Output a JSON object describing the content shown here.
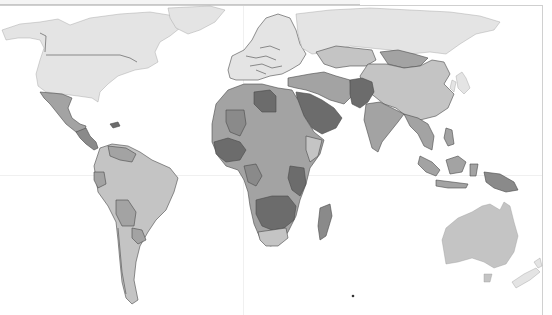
{
  "map": {
    "type": "choropleth",
    "projection": "world",
    "legend_visible": false,
    "title_visible": false,
    "shade_classes": {
      "very_light": "#e4e4e4",
      "light": "#c4c4c4",
      "medium": "#a3a3a3",
      "medium_dark": "#8a8a8a",
      "dark": "#6c6c6c"
    },
    "background": "#ffffff",
    "ocean": "#ffffff",
    "regions": [
      {
        "name": "north-america",
        "shade": "very_light"
      },
      {
        "name": "greenland",
        "shade": "very_light"
      },
      {
        "name": "europe",
        "shade": "very_light"
      },
      {
        "name": "russia",
        "shade": "very_light"
      },
      {
        "name": "mexico",
        "shade": "medium"
      },
      {
        "name": "central-america",
        "shade": "medium_dark"
      },
      {
        "name": "south-america",
        "shade": "light"
      },
      {
        "name": "bolivia",
        "shade": "medium"
      },
      {
        "name": "paraguay",
        "shade": "medium"
      },
      {
        "name": "peru-ecuador",
        "shade": "medium"
      },
      {
        "name": "venezuela-guyana",
        "shade": "medium"
      },
      {
        "name": "north-africa",
        "shade": "medium"
      },
      {
        "name": "libya",
        "shade": "dark"
      },
      {
        "name": "mali",
        "shade": "medium_dark"
      },
      {
        "name": "west-africa",
        "shade": "dark"
      },
      {
        "name": "central-africa",
        "shade": "medium"
      },
      {
        "name": "east-africa",
        "shade": "dark"
      },
      {
        "name": "southern-africa",
        "shade": "dark"
      },
      {
        "name": "south-africa",
        "shade": "light"
      },
      {
        "name": "madagascar",
        "shade": "medium_dark"
      },
      {
        "name": "arabian-peninsula",
        "shade": "dark"
      },
      {
        "name": "turkey-iran",
        "shade": "medium"
      },
      {
        "name": "afghanistan-pakistan",
        "shade": "dark"
      },
      {
        "name": "kazakhstan",
        "shade": "light"
      },
      {
        "name": "mongolia",
        "shade": "medium"
      },
      {
        "name": "china",
        "shade": "light"
      },
      {
        "name": "india",
        "shade": "medium"
      },
      {
        "name": "southeast-asia",
        "shade": "medium"
      },
      {
        "name": "indonesia",
        "shade": "medium"
      },
      {
        "name": "papua-new-guinea",
        "shade": "medium_dark"
      },
      {
        "name": "japan-korea",
        "shade": "very_light"
      },
      {
        "name": "australia",
        "shade": "light"
      },
      {
        "name": "new-zealand",
        "shade": "very_light"
      }
    ]
  }
}
